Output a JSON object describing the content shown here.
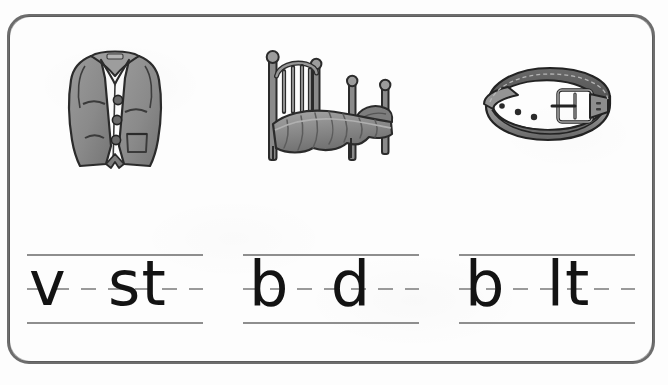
{
  "worksheet": {
    "type": "phonics-worksheet",
    "theme": "short-e-medial-vowel",
    "border_color": "#6d6d6d",
    "paper_color": "#fdfdfd",
    "ink_color": "#131313",
    "rule_color": "#8e8e8e"
  },
  "items": [
    {
      "id": "item-1",
      "picture": {
        "name": "vest-illustration",
        "alt": "vest",
        "colors": {
          "fill": "#8c8c8c",
          "shadow": "#6e6e6e",
          "highlight": "#a3a3a3",
          "outline": "#2b2b2b"
        }
      },
      "answer_word": "vest",
      "missing_letter": "e",
      "letters_shown": "v  st",
      "letters_before_blank": "v",
      "letters_after_blank": "st"
    },
    {
      "id": "item-2",
      "picture": {
        "name": "bed-illustration",
        "alt": "bed",
        "colors": {
          "fill": "#8c8c8c",
          "shadow": "#6b6b6b",
          "highlight": "#a5a5a5",
          "outline": "#2b2b2b"
        }
      },
      "answer_word": "bed",
      "missing_letter": "e",
      "letters_shown": "b  d",
      "letters_before_blank": "b",
      "letters_after_blank": "d"
    },
    {
      "id": "item-3",
      "picture": {
        "name": "belt-illustration",
        "alt": "belt",
        "colors": {
          "fill": "#8f8f8f",
          "shadow": "#5f5f5f",
          "highlight": "#ababab",
          "outline": "#2b2b2b"
        }
      },
      "answer_word": "belt",
      "missing_letter": "e",
      "letters_shown": "b  lt",
      "letters_before_blank": "b",
      "letters_after_blank": "lt"
    }
  ],
  "writing_lines": {
    "count": 3,
    "style": "three-rule-handwriting",
    "top_rule": "solid",
    "middle_rule": "dashed",
    "bottom_rule": "solid"
  }
}
